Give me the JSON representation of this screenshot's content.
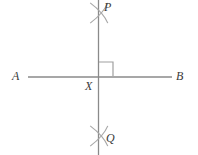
{
  "figure": {
    "name": "perpendicular-bisector-construction",
    "canvas": {
      "width": 198,
      "height": 155,
      "background": "#ffffff"
    },
    "colors": {
      "line": "#8a8a8a",
      "arc": "#a8a8a8",
      "right_angle": "#a0a0a0",
      "label": "#3a3a3a"
    },
    "labels": {
      "A": "A",
      "B": "B",
      "P": "P",
      "Q": "Q",
      "X": "X"
    },
    "lines": [
      {
        "id": "line-AB",
        "from_label": "A",
        "to_label": "B",
        "x1": 28,
        "y1": 77,
        "x2": 172,
        "y2": 77
      },
      {
        "id": "line-PQ",
        "from_label": "P",
        "to_label": "Q",
        "x1": 98.5,
        "y1": 0,
        "x2": 98.5,
        "y2": 155
      }
    ],
    "intersection": {
      "label": "X",
      "x": 98.5,
      "y": 77
    },
    "right_angle_mark": {
      "x": 99,
      "y": 62,
      "size": 14,
      "quadrant": "upper-right"
    },
    "arc_marks": [
      {
        "id": "arc-cross-P",
        "cx": 99,
        "cy": 13,
        "radius": 11
      },
      {
        "id": "arc-cross-Q",
        "cx": 99,
        "cy": 136,
        "radius": 11
      }
    ]
  }
}
